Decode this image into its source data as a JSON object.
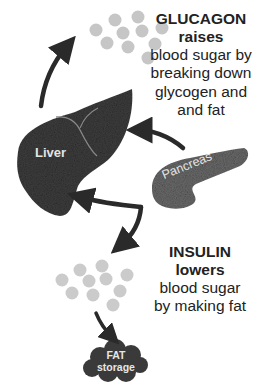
{
  "diagram": {
    "glucagon": {
      "hormone": "GLUCAGON",
      "action": "raises",
      "description_lines": [
        "blood sugar by",
        "breaking down",
        "glycogen and",
        "and fat"
      ]
    },
    "insulin": {
      "hormone": "INSULIN",
      "action": "lowers",
      "description_lines": [
        "blood sugar",
        "by making fat"
      ]
    },
    "organs": {
      "liver": "Liver",
      "pancreas": "Pancreas"
    },
    "fat_storage": {
      "line1": "FAT",
      "line2": "storage"
    },
    "arrows": [
      {
        "from": "liver",
        "to": "glucose-cluster-top",
        "label": ""
      },
      {
        "from": "pancreas",
        "to": "liver",
        "label": ""
      },
      {
        "from": "pancreas",
        "to": "liver",
        "label": ""
      },
      {
        "from": "pancreas",
        "to": "glucose-cluster-bottom",
        "label": ""
      },
      {
        "from": "glucose-cluster-bottom",
        "to": "fat-storage",
        "label": ""
      }
    ],
    "colors": {
      "organ_dark": "#3c3c3c",
      "pancreas": "#6e6e6e",
      "glucose_dot": "#c8c8c8",
      "arrow": "#2a2a2a",
      "text": "#222222"
    }
  }
}
